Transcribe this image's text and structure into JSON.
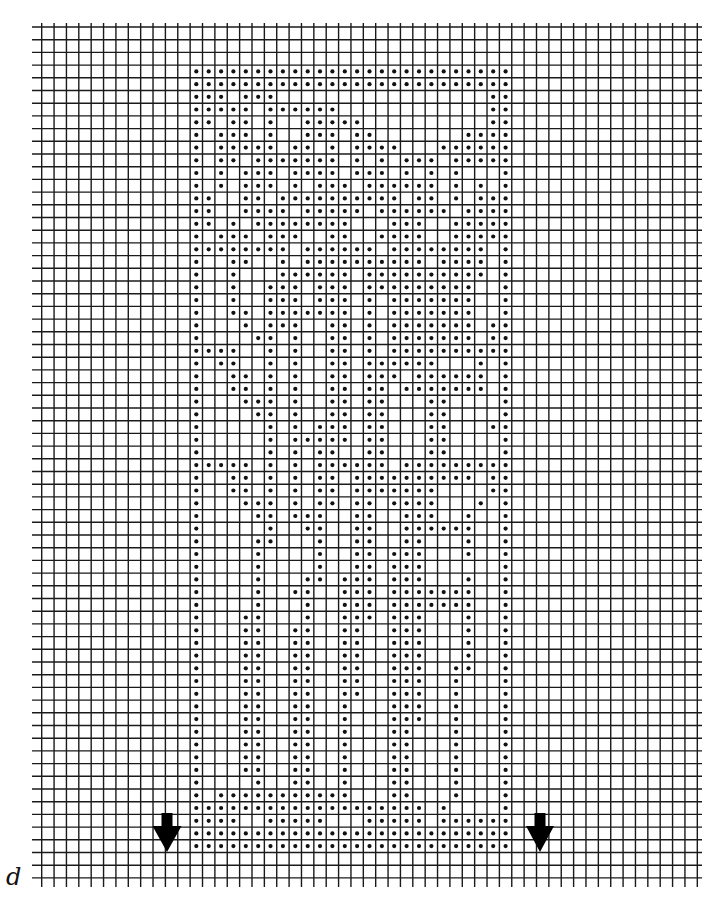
{
  "chart": {
    "type": "filet-crochet-chart",
    "label": "d",
    "grid": {
      "columns": 53,
      "rows": 67,
      "line_color": "#1a1a1a",
      "origin_x": 41.7,
      "origin_y": 27,
      "cell_w": 12.37,
      "cell_h": 12.7,
      "h_line_x_start": 32,
      "h_line_x_end": 702,
      "v_line_y_start": 23,
      "v_line_y_end": 887
    },
    "pattern": {
      "dot_color": "#111111",
      "col_offset": 12,
      "row_offset": 3,
      "width": 26,
      "height": 62,
      "rows": [
        [
          0,
          1,
          2,
          3,
          4,
          5,
          6,
          7,
          8,
          9,
          10,
          11,
          12,
          13,
          14,
          15,
          16,
          17,
          18,
          19,
          20,
          21,
          22,
          23,
          24,
          25
        ],
        [
          0,
          1,
          2,
          3,
          4,
          5,
          6,
          7,
          8,
          9,
          10,
          11,
          12,
          13,
          14,
          15,
          16,
          17,
          18,
          19,
          20,
          21,
          22,
          23,
          24,
          25
        ],
        [
          0,
          1,
          2,
          4,
          5,
          6,
          24,
          25
        ],
        [
          0,
          1,
          2,
          3,
          4,
          6,
          7,
          8,
          9,
          10,
          11,
          24,
          25
        ],
        [
          0,
          1,
          3,
          4,
          6,
          9,
          10,
          11,
          12,
          13,
          24,
          25
        ],
        [
          0,
          2,
          3,
          4,
          6,
          9,
          10,
          11,
          13,
          14,
          22,
          23,
          24,
          25
        ],
        [
          0,
          2,
          3,
          4,
          5,
          6,
          8,
          9,
          11,
          13,
          14,
          15,
          16,
          20,
          21,
          22,
          23,
          24,
          25
        ],
        [
          0,
          2,
          3,
          5,
          6,
          7,
          8,
          9,
          10,
          11,
          13,
          15,
          17,
          18,
          19,
          21,
          22,
          23,
          24,
          25
        ],
        [
          0,
          2,
          4,
          5,
          6,
          8,
          9,
          10,
          11,
          13,
          14,
          15,
          17,
          19,
          21,
          25
        ],
        [
          0,
          2,
          4,
          5,
          6,
          8,
          10,
          11,
          12,
          14,
          15,
          16,
          17,
          18,
          19,
          21,
          23,
          25
        ],
        [
          0,
          1,
          4,
          5,
          7,
          8,
          9,
          10,
          11,
          12,
          13,
          14,
          15,
          16,
          18,
          19,
          21,
          23,
          24,
          25
        ],
        [
          0,
          1,
          4,
          5,
          6,
          7,
          9,
          10,
          11,
          12,
          13,
          15,
          16,
          17,
          18,
          19,
          20,
          22,
          23,
          24,
          25
        ],
        [
          0,
          1,
          3,
          5,
          6,
          7,
          8,
          9,
          10,
          11,
          12,
          16,
          17,
          18,
          21,
          22,
          23,
          24,
          25
        ],
        [
          0,
          2,
          3,
          4,
          6,
          7,
          8,
          11,
          12,
          15,
          16,
          17,
          18,
          21,
          22,
          23,
          24,
          25
        ],
        [
          0,
          1,
          2,
          3,
          4,
          5,
          6,
          7,
          9,
          10,
          11,
          12,
          13,
          14,
          16,
          17,
          18,
          19,
          20,
          21,
          22,
          23,
          25
        ],
        [
          0,
          3,
          4,
          7,
          9,
          10,
          11,
          12,
          13,
          14,
          15,
          16,
          17,
          18,
          20,
          21,
          22,
          23,
          25
        ],
        [
          0,
          3,
          7,
          8,
          9,
          10,
          11,
          12,
          14,
          15,
          16,
          17,
          18,
          19,
          20,
          21,
          22,
          23,
          25
        ],
        [
          0,
          3,
          6,
          7,
          8,
          10,
          11,
          12,
          14,
          15,
          16,
          17,
          18,
          19,
          20,
          21,
          22,
          25
        ],
        [
          0,
          3,
          6,
          7,
          8,
          10,
          11,
          12,
          14,
          16,
          17,
          18,
          19,
          20,
          21,
          22,
          25
        ],
        [
          0,
          3,
          4,
          6,
          7,
          8,
          9,
          10,
          11,
          12,
          14,
          16,
          17,
          18,
          19,
          20,
          21,
          22,
          25
        ],
        [
          0,
          4,
          6,
          7,
          8,
          11,
          12,
          14,
          16,
          17,
          18,
          19,
          20,
          21,
          22,
          24,
          25
        ],
        [
          0,
          5,
          6,
          8,
          11,
          12,
          14,
          16,
          17,
          18,
          19,
          20,
          21,
          22,
          24,
          25
        ],
        [
          0,
          1,
          2,
          3,
          6,
          8,
          11,
          12,
          14,
          16,
          17,
          18,
          19,
          20,
          21,
          22,
          23,
          24,
          25
        ],
        [
          0,
          2,
          3,
          6,
          8,
          11,
          12,
          14,
          15,
          16,
          17,
          18,
          19,
          23,
          25
        ],
        [
          0,
          3,
          4,
          6,
          8,
          11,
          12,
          14,
          15,
          16,
          18,
          19,
          20,
          21,
          22,
          23,
          25
        ],
        [
          0,
          3,
          4,
          6,
          8,
          11,
          12,
          14,
          15,
          17,
          18,
          19,
          20,
          21,
          22,
          23,
          25
        ],
        [
          0,
          4,
          5,
          6,
          8,
          11,
          12,
          14,
          15,
          19,
          20,
          25
        ],
        [
          0,
          5,
          6,
          8,
          11,
          12,
          14,
          15,
          19,
          20,
          25
        ],
        [
          0,
          6,
          8,
          10,
          11,
          12,
          14,
          15,
          19,
          20,
          24,
          25
        ],
        [
          0,
          6,
          8,
          9,
          10,
          11,
          12,
          14,
          15,
          19,
          20,
          25
        ],
        [
          0,
          6,
          8,
          10,
          11,
          14,
          15,
          19,
          20,
          25
        ],
        [
          0,
          1,
          2,
          3,
          4,
          6,
          8,
          10,
          11,
          12,
          13,
          14,
          15,
          17,
          18,
          19,
          20,
          21,
          22,
          23,
          24,
          25
        ],
        [
          0,
          3,
          4,
          6,
          8,
          10,
          11,
          13,
          14,
          15,
          16,
          17,
          18,
          19,
          20,
          21,
          22,
          24,
          25
        ],
        [
          0,
          3,
          4,
          6,
          8,
          10,
          11,
          13,
          14,
          15,
          16,
          17,
          18,
          19,
          24,
          25
        ],
        [
          0,
          4,
          5,
          6,
          8,
          10,
          11,
          13,
          14,
          16,
          17,
          18,
          19,
          23,
          25
        ],
        [
          0,
          5,
          6,
          8,
          9,
          10,
          13,
          14,
          17,
          18,
          19,
          22,
          25
        ],
        [
          0,
          6,
          9,
          10,
          13,
          14,
          17,
          18,
          19,
          20,
          21,
          22,
          25
        ],
        [
          0,
          5,
          6,
          10,
          13,
          14,
          17,
          18,
          22,
          25
        ],
        [
          0,
          5,
          10,
          13,
          14,
          16,
          17,
          18,
          22,
          25
        ],
        [
          0,
          5,
          10,
          13,
          14,
          16,
          17,
          18,
          25
        ],
        [
          0,
          5,
          9,
          10,
          12,
          13,
          14,
          16,
          17,
          18,
          22,
          25
        ],
        [
          0,
          5,
          8,
          9,
          12,
          13,
          14,
          16,
          17,
          18,
          19,
          20,
          21,
          22,
          25
        ],
        [
          0,
          5,
          9,
          12,
          13,
          14,
          16,
          17,
          18,
          19,
          20,
          21,
          22,
          25
        ],
        [
          0,
          4,
          5,
          9,
          12,
          13,
          14,
          16,
          17,
          18,
          22,
          25
        ],
        [
          0,
          4,
          5,
          8,
          9,
          12,
          13,
          16,
          17,
          18,
          22,
          25
        ],
        [
          0,
          4,
          5,
          8,
          9,
          12,
          13,
          16,
          17,
          18,
          22,
          25
        ],
        [
          0,
          4,
          5,
          8,
          9,
          12,
          13,
          16,
          17,
          18,
          22,
          25
        ],
        [
          0,
          4,
          5,
          8,
          9,
          12,
          13,
          16,
          17,
          18,
          21,
          22,
          25
        ],
        [
          0,
          4,
          5,
          8,
          9,
          12,
          13,
          16,
          17,
          18,
          21,
          25
        ],
        [
          0,
          4,
          5,
          8,
          9,
          12,
          13,
          16,
          17,
          18,
          21,
          25
        ],
        [
          0,
          4,
          5,
          8,
          9,
          12,
          16,
          17,
          18,
          21,
          25
        ],
        [
          0,
          4,
          5,
          8,
          9,
          12,
          16,
          17,
          18,
          21,
          25
        ],
        [
          0,
          4,
          5,
          8,
          9,
          12,
          16,
          17,
          21,
          25
        ],
        [
          0,
          4,
          5,
          8,
          9,
          12,
          16,
          17,
          21,
          25
        ],
        [
          0,
          4,
          5,
          8,
          9,
          12,
          16,
          17,
          21,
          25
        ],
        [
          0,
          4,
          5,
          8,
          9,
          12,
          16,
          17,
          21,
          25
        ],
        [
          0,
          5,
          8,
          9,
          12,
          16,
          17,
          21,
          25
        ],
        [
          0,
          2,
          3,
          4,
          5,
          6,
          7,
          8,
          9,
          10,
          11,
          12,
          16,
          17,
          21,
          25
        ],
        [
          0,
          1,
          2,
          3,
          4,
          5,
          6,
          7,
          8,
          9,
          10,
          11,
          12,
          13,
          14,
          15,
          16,
          17,
          18,
          20,
          25
        ],
        [
          0,
          1,
          2,
          3,
          6,
          7,
          8,
          9,
          10,
          14,
          15,
          16,
          17,
          18,
          20,
          21,
          22,
          23,
          24,
          25
        ],
        [
          0,
          1,
          2,
          3,
          4,
          5,
          6,
          7,
          8,
          9,
          10,
          11,
          12,
          13,
          14,
          15,
          16,
          17,
          18,
          19,
          20,
          21,
          22,
          23,
          24,
          25
        ],
        [
          0,
          1,
          2,
          3,
          4,
          5,
          6,
          7,
          8,
          9,
          10,
          11,
          12,
          13,
          14,
          15,
          16,
          17,
          18,
          19,
          20,
          21,
          22,
          23,
          24,
          25
        ]
      ]
    },
    "arrows": [
      {
        "name": "start-arrow-left",
        "direction": "down",
        "tip_x": 167,
        "tip_y": 852,
        "shaft_top": 813,
        "shaft_half_w": 5.5,
        "head_top": 826,
        "head_half_w": 14.5
      },
      {
        "name": "start-arrow-right",
        "direction": "down",
        "tip_x": 540,
        "tip_y": 852,
        "shaft_top": 813,
        "shaft_half_w": 5.5,
        "head_top": 826,
        "head_half_w": 14
      }
    ],
    "label_pos": {
      "x": 6,
      "y": 885
    }
  }
}
